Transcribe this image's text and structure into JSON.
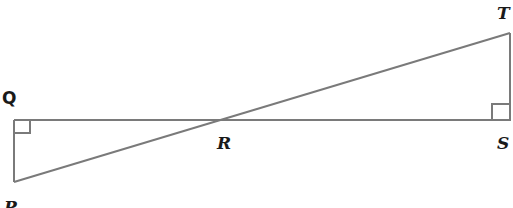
{
  "diagram": {
    "colors": {
      "line": "#7a7a7a",
      "label": "#1a1a1a",
      "background": "#ffffff"
    },
    "points": {
      "Q": {
        "label": "Q",
        "x": 14,
        "y": 120
      },
      "P": {
        "label": "P",
        "x": 14,
        "y": 182
      },
      "R": {
        "label": "R",
        "x": 212,
        "y": 120
      },
      "S": {
        "label": "S",
        "x": 511,
        "y": 120
      },
      "T": {
        "label": "T",
        "x": 510,
        "y": 33
      }
    },
    "segments": [
      "QS",
      "PQ",
      "PT",
      "ST"
    ],
    "right_angles": [
      "Q",
      "S"
    ]
  }
}
